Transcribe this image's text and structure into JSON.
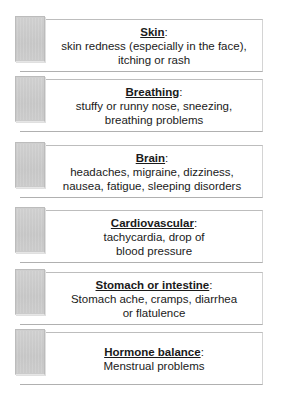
{
  "cards": [
    {
      "title": "Skin",
      "colon": ":",
      "lines": [
        "skin redness (especially in the face),",
        "itching or rash"
      ]
    },
    {
      "title": "Breathing",
      "colon": ":",
      "lines": [
        "stuffy or runny nose, sneezing,",
        "breathing problems"
      ]
    },
    {
      "title": "Brain",
      "colon": ":",
      "lines": [
        "headaches, migraine, dizziness,",
        "nausea, fatigue, sleeping disorders"
      ]
    },
    {
      "title": "Cardiovascular",
      "colon": ":",
      "lines": [
        "tachycardia, drop of",
        "blood pressure"
      ]
    },
    {
      "title": "Stomach or intestine",
      "colon": ":",
      "lines": [
        "Stomach ache, cramps, diarrhea",
        "or flatulence"
      ]
    },
    {
      "title": "Hormone balance",
      "colon": ":",
      "lines": [
        "Menstrual problems"
      ]
    }
  ],
  "colors": {
    "tab": "#c8c8c8",
    "border": "#bdbdbd",
    "text": "#1a1a1a"
  }
}
